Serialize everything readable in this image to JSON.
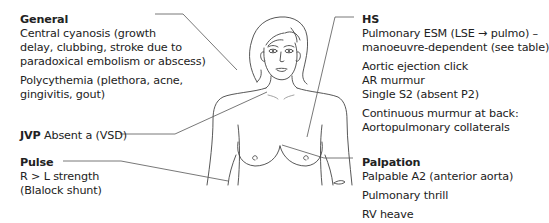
{
  "diagram": {
    "stroke_color": "#444444",
    "leader_color": "#555555"
  },
  "general": {
    "title": "General",
    "lines": [
      "Central cyanosis (growth",
      "delay, clubbing, stroke due to",
      "paradoxical embolism or abscess)"
    ],
    "lines2": [
      "Polycythemia (plethora, acne,",
      "gingivitis, gout)"
    ]
  },
  "jvp": {
    "title": "JVP",
    "text": "Absent a (VSD)"
  },
  "pulse": {
    "title": "Pulse",
    "lines": [
      "R > L strength",
      "(Blalock shunt)"
    ]
  },
  "hs": {
    "title": "HS",
    "lines": [
      "Pulmonary ESM (LSE → pulmo) –",
      "manoeuvre-dependent (see table)"
    ],
    "lines2": [
      "Aortic ejection click",
      "AR murmur",
      "Single S2 (absent P2)"
    ],
    "lines3": [
      "Continuous murmur at back:",
      "Aortopulmonary collaterals"
    ]
  },
  "palpation": {
    "title": "Palpation",
    "lines": [
      "Palpable A2 (anterior aorta)"
    ],
    "lines2": [
      "Pulmonary thrill"
    ],
    "lines3": [
      "RV heave"
    ]
  }
}
